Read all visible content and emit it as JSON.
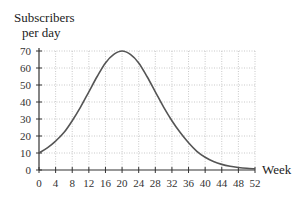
{
  "chart_data": {
    "type": "line",
    "title": "",
    "ylabel": "Subscribers per day",
    "ylabel_lines": [
      "Subscribers",
      "per day"
    ],
    "xlabel": "Week",
    "xlim": [
      0,
      52
    ],
    "ylim": [
      0,
      70
    ],
    "xticks": [
      0,
      4,
      8,
      12,
      16,
      20,
      24,
      28,
      32,
      36,
      40,
      44,
      48,
      52
    ],
    "yticks": [
      0,
      10,
      20,
      30,
      40,
      50,
      60,
      70
    ],
    "grid": true,
    "legend": null,
    "series": [
      {
        "name": "Subscribers per day",
        "color": "#555555",
        "x": [
          0,
          2,
          4,
          6,
          8,
          10,
          12,
          14,
          16,
          18,
          20,
          22,
          24,
          26,
          28,
          30,
          32,
          34,
          36,
          38,
          40,
          42,
          44,
          46,
          48,
          50,
          52
        ],
        "y": [
          10,
          13,
          17,
          22,
          29,
          37,
          46,
          55,
          63,
          68,
          70,
          68,
          63,
          55,
          46,
          37,
          29,
          22,
          16,
          11,
          7.5,
          5,
          3.3,
          2.2,
          1.5,
          1,
          0.7
        ]
      }
    ]
  }
}
